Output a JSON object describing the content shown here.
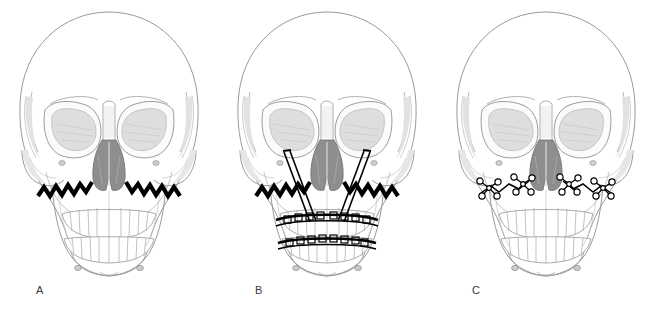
{
  "figure": {
    "background_color": "#ffffff",
    "width": 655,
    "height": 315,
    "panel_count": 3
  },
  "panels": [
    {
      "label": "A",
      "name": "panel-a",
      "caption_text": "A",
      "content": "skull with zigzag osteotomy cut lines across the maxilla",
      "hardware": "none",
      "osteotomy_line_style": "zigzag",
      "osteotomy_color": "#000000"
    },
    {
      "label": "B",
      "name": "panel-b",
      "caption_text": "B",
      "content": "skull with zigzag osteotomy lines, paired traction rods and upper and lower arch bars",
      "hardware": "traction rods and arch bars",
      "osteotomy_line_style": "zigzag",
      "osteotomy_color": "#000000",
      "rod_count": 2,
      "arch_bar_count": 2
    },
    {
      "label": "C",
      "name": "panel-c",
      "caption_text": "C",
      "content": "skull with bone plates and screws fixating the maxillary osteotomy",
      "hardware": "bone plates with screw holes",
      "osteotomy_line_style": "zigzag",
      "osteotomy_color": "#000000",
      "plate_clusters": 4
    }
  ],
  "colors": {
    "outline": "#8c8c8c",
    "outline_light": "#b4b4b4",
    "shading_light": "#d8d8d8",
    "shading_mid": "#bdbdbd",
    "nasal_cavity": "#8e8e8e",
    "hardware": "#000000",
    "label_text": "#3a3a3a",
    "background": "#ffffff"
  },
  "anatomy_features": [
    "cranial vault",
    "frontal bone",
    "orbital rims",
    "orbits",
    "nasal aperture",
    "nasal septum",
    "zygomatic bones",
    "maxilla",
    "maxillary dentition",
    "mandible",
    "mandibular dentition",
    "mental foramina",
    "temporal lines"
  ]
}
